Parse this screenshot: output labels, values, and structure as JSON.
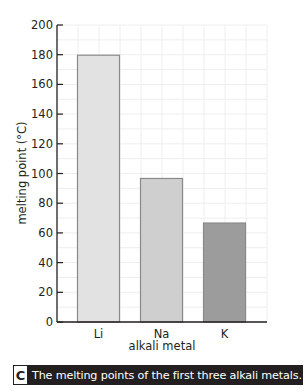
{
  "chart_data": {
    "type": "bar",
    "title": "",
    "categories": [
      "Li",
      "Na",
      "K"
    ],
    "values": [
      180,
      97,
      67
    ],
    "bar_colors": [
      "#e2e2e2",
      "#cfcfcf",
      "#9c9c9c"
    ],
    "xlabel": "alkali metal",
    "ylabel": "melting point (°C)",
    "ylim": [
      0,
      200
    ],
    "yticks": [
      0,
      20,
      40,
      60,
      80,
      100,
      120,
      140,
      160,
      180,
      200
    ],
    "grid": true,
    "legend": null
  },
  "caption": {
    "letter": "C",
    "text": "The melting points of the first three alkali metals."
  },
  "colors": {
    "axis": "#231f20",
    "grid": "#eeeeee",
    "bar_border": "#8a8a8a",
    "caption_bg": "#231f20",
    "caption_fg": "#ffffff"
  }
}
